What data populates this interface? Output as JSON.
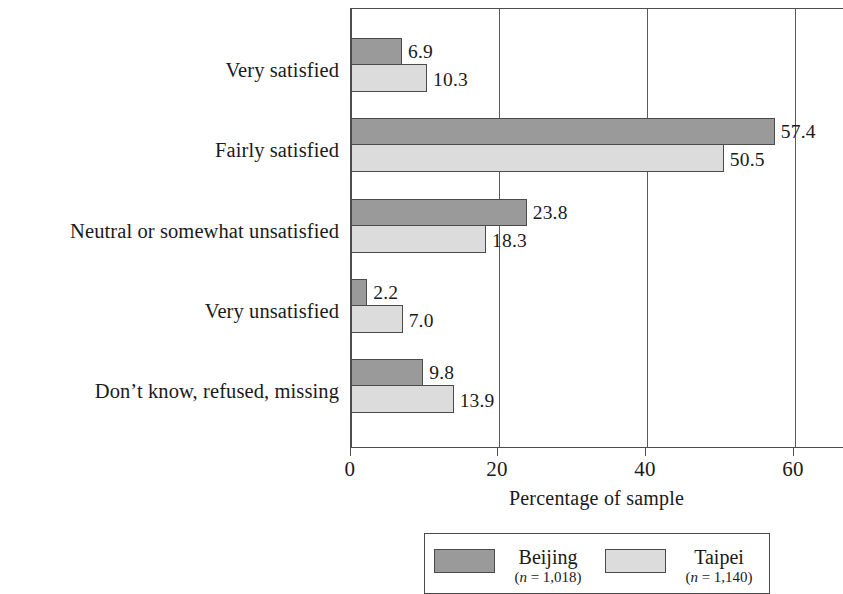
{
  "chart_data": {
    "type": "bar",
    "orientation": "horizontal",
    "title": "",
    "xlabel": "Percentage of sample",
    "ylabel": "",
    "xlim": [
      0,
      66.8
    ],
    "xticks": [
      0,
      20,
      40,
      60
    ],
    "xtick_labels": [
      "0",
      "20",
      "40",
      "60"
    ],
    "grid": "vertical gridlines at x ticks",
    "legend_position": "below plot, centered, boxed",
    "categories": [
      "Very satisfied",
      "Fairly satisfied",
      "Neutral or somewhat unsatisfied",
      "Very unsatisfied",
      "Don’t know, refused, missing"
    ],
    "series": [
      {
        "name": "Beijing",
        "n_label": "(n = 1,018)",
        "n": 1018,
        "color": "#9a9a9a",
        "values": [
          6.9,
          57.4,
          23.8,
          2.2,
          9.8
        ],
        "value_labels": [
          "6.9",
          "57.4",
          "23.8",
          "2.2",
          "9.8"
        ]
      },
      {
        "name": "Taipei",
        "n_label": "(n = 1,140)",
        "n": 1140,
        "color": "#dcdcdc",
        "values": [
          10.3,
          50.5,
          18.3,
          7.0,
          13.9
        ],
        "value_labels": [
          "10.3",
          "50.5",
          "18.3",
          "7.0",
          "13.9"
        ]
      }
    ]
  },
  "axis": {
    "x_title": "Percentage of sample",
    "ticks": [
      "0",
      "20",
      "40",
      "60"
    ]
  },
  "legend": {
    "entries": [
      {
        "name": "Beijing",
        "n_label": "(n = 1,018)",
        "n_prefix": "(",
        "n_var": "n",
        "n_rest": " = 1,018)"
      },
      {
        "name": "Taipei",
        "n_label": "(n = 1,140)",
        "n_prefix": "(",
        "n_var": "n",
        "n_rest": " = 1,140)"
      }
    ]
  },
  "colors": {
    "series_a": "#9a9a9a",
    "series_b": "#dcdcdc",
    "axis": "#4d4d4d",
    "background": "#ffffff"
  }
}
